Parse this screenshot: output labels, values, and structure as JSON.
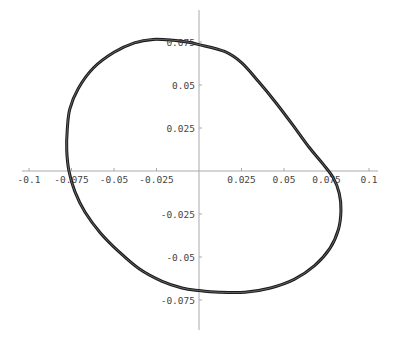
{
  "chart_data": {
    "type": "line",
    "title": "",
    "xlabel": "",
    "ylabel": "",
    "xlim": [
      -0.1,
      0.1
    ],
    "ylim": [
      -0.075,
      0.075
    ],
    "grid": false,
    "legend": null,
    "x_ticks": [
      -0.1,
      -0.075,
      -0.05,
      -0.025,
      0.025,
      0.05,
      0.075,
      0.1
    ],
    "x_tick_labels": [
      "-0.1",
      "-0.075",
      "-0.05",
      "-0.025",
      "0.025",
      "0.05",
      "0.075",
      "0.1"
    ],
    "y_ticks": [
      0.075,
      0.05,
      0.025,
      -0.025,
      -0.05,
      -0.075
    ],
    "y_tick_labels": [
      "0.075",
      "0.05",
      "0.025",
      "-0.025",
      "-0.05",
      "-0.075"
    ],
    "series": [
      {
        "name": "closed orbit",
        "color": "#1a1a1a",
        "closed": true,
        "points": [
          [
            0.0,
            0.0735
          ],
          [
            0.015,
            0.0695
          ],
          [
            0.025,
            0.063
          ],
          [
            0.035,
            0.052
          ],
          [
            0.045,
            0.04
          ],
          [
            0.055,
            0.027
          ],
          [
            0.065,
            0.0135
          ],
          [
            0.073,
            0.004
          ],
          [
            0.079,
            -0.004
          ],
          [
            0.0825,
            -0.013
          ],
          [
            0.0835,
            -0.023
          ],
          [
            0.082,
            -0.034
          ],
          [
            0.077,
            -0.045
          ],
          [
            0.068,
            -0.055
          ],
          [
            0.056,
            -0.063
          ],
          [
            0.042,
            -0.068
          ],
          [
            0.027,
            -0.0705
          ],
          [
            0.012,
            -0.0705
          ],
          [
            0.0,
            -0.0695
          ],
          [
            -0.01,
            -0.068
          ],
          [
            -0.022,
            -0.064
          ],
          [
            -0.035,
            -0.057
          ],
          [
            -0.047,
            -0.047
          ],
          [
            -0.058,
            -0.036
          ],
          [
            -0.067,
            -0.024
          ],
          [
            -0.073,
            -0.012
          ],
          [
            -0.0765,
            0.0
          ],
          [
            -0.0778,
            0.012
          ],
          [
            -0.0775,
            0.024
          ],
          [
            -0.076,
            0.036
          ],
          [
            -0.071,
            0.048
          ],
          [
            -0.062,
            0.06
          ],
          [
            -0.05,
            0.069
          ],
          [
            -0.038,
            0.0745
          ],
          [
            -0.027,
            0.0765
          ],
          [
            -0.015,
            0.076
          ],
          [
            -0.007,
            0.075
          ]
        ]
      }
    ]
  },
  "layout": {
    "origin_px": [
      199,
      171
    ],
    "px_per_unit_x": 1700,
    "px_per_unit_y": 1720,
    "x_axis_extent_px": [
      22,
      378
    ],
    "y_axis_extent_px": [
      10,
      330
    ]
  }
}
